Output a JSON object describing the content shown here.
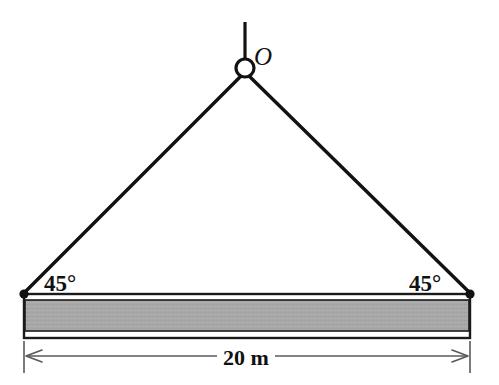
{
  "figure": {
    "width": 499,
    "height": 385,
    "background": "#ffffff"
  },
  "labels": {
    "angle_left": "45°",
    "angle_right": "45°",
    "apex_point": "O",
    "dimension": "20 m"
  },
  "colors": {
    "line": "#121212",
    "beam_fill": "#a8a8a8",
    "beam_edge": "#1a1a1a",
    "beam_inner_white": "#ffffff",
    "dimension_line": "#5a5a5a"
  },
  "geometry": {
    "apex": {
      "x": 245,
      "y": 68
    },
    "ring_radius": 9,
    "hanger_top": {
      "x": 245,
      "y": 22
    },
    "cable_left_end": {
      "x": 24,
      "y": 294
    },
    "cable_right_end": {
      "x": 470,
      "y": 294
    },
    "cable_angle_deg": 45,
    "cable_width": 3.2,
    "beam": {
      "x": 24,
      "y": 294,
      "width": 446,
      "height": 44
    },
    "beam_band": {
      "top": 300,
      "bottom": 331
    },
    "dimension_line_y": 356,
    "extension_line_bottom": 373
  }
}
